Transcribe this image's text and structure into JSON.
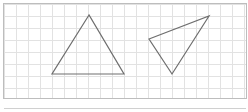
{
  "diagram": {
    "background": "#ffffff",
    "grid": {
      "x0": 4,
      "y0": 4,
      "x1": 246,
      "y1": 98,
      "spacing": 12,
      "color": "#e2e2e2",
      "border_color": "#bdbdbd"
    },
    "bottom_rule": {
      "y": 108,
      "color": "#d0d0d0"
    },
    "shapes": [
      {
        "name": "triangle-a",
        "points": "89,15 52,74 124,74",
        "stroke": "#6e6e6e"
      },
      {
        "name": "triangle-b",
        "points": "149,39 209,16 172,74",
        "stroke": "#6e6e6e"
      }
    ]
  }
}
